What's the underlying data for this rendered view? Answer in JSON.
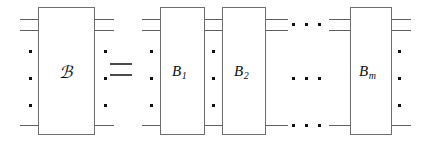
{
  "figure": {
    "type": "quantum-circuit-identity-diagram",
    "background_color": "#ffffff",
    "line_color": "#606060",
    "text_color": "#111111",
    "relation_symbol": "=",
    "left_side": {
      "operator_label": "ℬ",
      "operator_label_plain": "O",
      "gate_name": "script-O"
    },
    "right_side": {
      "gates": [
        {
          "base": "B",
          "subscript": "1"
        },
        {
          "base": "B",
          "subscript": "2"
        },
        {
          "base": "B",
          "subscript": "m"
        }
      ],
      "ellipsis_glyph": "• • •",
      "ellipsis_rows": 3
    },
    "vertical_ellipsis_glyph": "⋮",
    "wire_rows_top": 2,
    "wire_rows_bottom": 1
  }
}
